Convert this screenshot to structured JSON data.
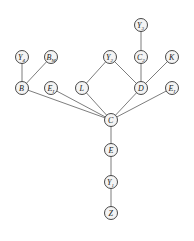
{
  "diagram": {
    "type": "directed-acyclic-graph",
    "nodes": [
      {
        "id": "Y3",
        "label": "Y",
        "sub": "3",
        "x": 141,
        "y": 25
      },
      {
        "id": "Y4",
        "label": "Y",
        "sub": "4",
        "x": 22,
        "y": 57
      },
      {
        "id": "BM",
        "label": "B",
        "sub": "M",
        "x": 51,
        "y": 57
      },
      {
        "id": "Y2",
        "label": "Y",
        "sub": "2",
        "x": 110,
        "y": 57
      },
      {
        "id": "C2",
        "label": "C",
        "sub": "2",
        "x": 141,
        "y": 57
      },
      {
        "id": "K",
        "label": "K",
        "sub": "",
        "x": 172,
        "y": 57
      },
      {
        "id": "B",
        "label": "B",
        "sub": "",
        "x": 22,
        "y": 88
      },
      {
        "id": "E1a",
        "label": "E",
        "sub": "I",
        "x": 51,
        "y": 88
      },
      {
        "id": "L",
        "label": "L",
        "sub": "",
        "x": 82,
        "y": 88
      },
      {
        "id": "D",
        "label": "D",
        "sub": "",
        "x": 141,
        "y": 88
      },
      {
        "id": "E1b",
        "label": "E",
        "sub": "I",
        "x": 172,
        "y": 88
      },
      {
        "id": "C",
        "label": "C",
        "sub": "",
        "x": 111,
        "y": 120
      },
      {
        "id": "E",
        "label": "E",
        "sub": "",
        "x": 111,
        "y": 150
      },
      {
        "id": "Y1",
        "label": "Y",
        "sub": "1",
        "x": 111,
        "y": 182
      },
      {
        "id": "Z",
        "label": "Z",
        "sub": "",
        "x": 111,
        "y": 213
      }
    ],
    "edges": [
      [
        "Y3",
        "C2"
      ],
      [
        "Y4",
        "B"
      ],
      [
        "BM",
        "B"
      ],
      [
        "Y2",
        "L"
      ],
      [
        "Y2",
        "D"
      ],
      [
        "C2",
        "D"
      ],
      [
        "K",
        "D"
      ],
      [
        "B",
        "C"
      ],
      [
        "E1a",
        "C"
      ],
      [
        "L",
        "C"
      ],
      [
        "D",
        "C"
      ],
      [
        "E1b",
        "C"
      ],
      [
        "C",
        "E"
      ],
      [
        "E",
        "Y1"
      ],
      [
        "Y1",
        "Z"
      ]
    ]
  },
  "labels": {
    "Y3": "Y",
    "Y3_sub": "3",
    "Y4": "Y",
    "Y4_sub": "4",
    "BM": "B",
    "BM_sub": "M",
    "Y2": "Y",
    "Y2_sub": "2",
    "C2": "C",
    "C2_sub": "2",
    "K": "K",
    "B": "B",
    "E1a": "E",
    "E1a_sub": "I",
    "L": "L",
    "D": "D",
    "E1b": "E",
    "E1b_sub": "I",
    "C": "C",
    "E": "E",
    "Y1": "Y",
    "Y1_sub": "1",
    "Z": "Z"
  }
}
